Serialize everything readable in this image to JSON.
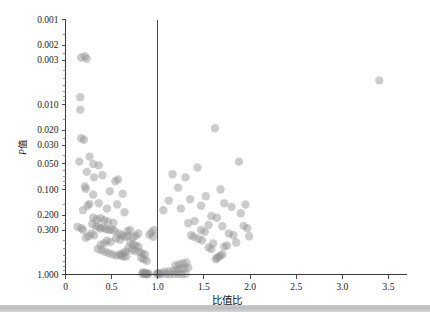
{
  "chart_data": {
    "type": "scatter",
    "title": "",
    "xlabel": "比值比",
    "ylabel": "P值",
    "ylabel_italic_part": "P",
    "ylabel_plain_part": "值",
    "xlim": [
      0,
      3.5
    ],
    "ylim": [
      1.0,
      0.001
    ],
    "y_scale": "log-inverted",
    "grid": false,
    "legend": null,
    "xticks": [
      0,
      0.5,
      1.0,
      1.5,
      2.0,
      2.5,
      3.0,
      3.5
    ],
    "xticklabels": [
      "0",
      "0.5",
      "1.0",
      "1.5",
      "2.0",
      "2.5",
      "3.0",
      "3.5"
    ],
    "yticks": [
      0.001,
      0.002,
      0.003,
      0.01,
      0.02,
      0.03,
      0.05,
      0.1,
      0.2,
      0.3,
      1.0
    ],
    "yticklabels": [
      "0.001",
      "0.002",
      "0.003",
      "0.010",
      "0.020",
      "0.030",
      "0.050",
      "0.100",
      "0.200",
      "0.300",
      "1.000"
    ],
    "reference_lines": [
      {
        "orientation": "vertical",
        "value": 1.0,
        "label": "null-effect-line"
      }
    ],
    "marker": {
      "shape": "circle",
      "color": "#8e8e8e",
      "opacity": 0.45,
      "radius_px": 4.2
    },
    "points": [
      {
        "x": 0.17,
        "y": 0.0028
      },
      {
        "x": 0.21,
        "y": 0.0027
      },
      {
        "x": 0.23,
        "y": 0.0029
      },
      {
        "x": 0.16,
        "y": 0.0082
      },
      {
        "x": 0.16,
        "y": 0.0115
      },
      {
        "x": 0.17,
        "y": 0.025
      },
      {
        "x": 0.15,
        "y": 0.047
      },
      {
        "x": 0.3,
        "y": 0.05
      },
      {
        "x": 3.4,
        "y": 0.0052
      },
      {
        "x": 1.62,
        "y": 0.019
      },
      {
        "x": 1.88,
        "y": 0.047
      },
      {
        "x": 0.2,
        "y": 0.026
      },
      {
        "x": 0.26,
        "y": 0.041
      },
      {
        "x": 0.36,
        "y": 0.052
      },
      {
        "x": 0.23,
        "y": 0.062
      },
      {
        "x": 0.4,
        "y": 0.068
      },
      {
        "x": 0.31,
        "y": 0.072
      },
      {
        "x": 0.21,
        "y": 0.092
      },
      {
        "x": 0.22,
        "y": 0.098
      },
      {
        "x": 0.54,
        "y": 0.08
      },
      {
        "x": 0.57,
        "y": 0.076
      },
      {
        "x": 0.48,
        "y": 0.105
      },
      {
        "x": 0.3,
        "y": 0.115
      },
      {
        "x": 0.62,
        "y": 0.112
      },
      {
        "x": 0.24,
        "y": 0.155
      },
      {
        "x": 0.26,
        "y": 0.148
      },
      {
        "x": 0.36,
        "y": 0.145
      },
      {
        "x": 0.45,
        "y": 0.168
      },
      {
        "x": 0.19,
        "y": 0.175
      },
      {
        "x": 0.56,
        "y": 0.15
      },
      {
        "x": 0.64,
        "y": 0.185
      },
      {
        "x": 1.16,
        "y": 0.066
      },
      {
        "x": 1.3,
        "y": 0.072
      },
      {
        "x": 1.22,
        "y": 0.095
      },
      {
        "x": 1.43,
        "y": 0.055
      },
      {
        "x": 1.12,
        "y": 0.135
      },
      {
        "x": 1.35,
        "y": 0.13
      },
      {
        "x": 1.52,
        "y": 0.12
      },
      {
        "x": 1.06,
        "y": 0.175
      },
      {
        "x": 1.25,
        "y": 0.168
      },
      {
        "x": 1.47,
        "y": 0.155
      },
      {
        "x": 1.68,
        "y": 0.1
      },
      {
        "x": 1.72,
        "y": 0.145
      },
      {
        "x": 1.8,
        "y": 0.16
      },
      {
        "x": 1.95,
        "y": 0.15
      },
      {
        "x": 1.9,
        "y": 0.19
      },
      {
        "x": 1.58,
        "y": 0.205
      },
      {
        "x": 1.64,
        "y": 0.215
      },
      {
        "x": 1.4,
        "y": 0.235
      },
      {
        "x": 1.33,
        "y": 0.25
      },
      {
        "x": 1.55,
        "y": 0.262
      },
      {
        "x": 1.7,
        "y": 0.27
      },
      {
        "x": 1.93,
        "y": 0.268
      },
      {
        "x": 1.97,
        "y": 0.285
      },
      {
        "x": 0.13,
        "y": 0.275
      },
      {
        "x": 0.17,
        "y": 0.285
      },
      {
        "x": 0.19,
        "y": 0.3
      },
      {
        "x": 0.29,
        "y": 0.255
      },
      {
        "x": 0.33,
        "y": 0.27
      },
      {
        "x": 0.36,
        "y": 0.278
      },
      {
        "x": 0.38,
        "y": 0.288
      },
      {
        "x": 0.41,
        "y": 0.282
      },
      {
        "x": 0.44,
        "y": 0.292
      },
      {
        "x": 0.47,
        "y": 0.3
      },
      {
        "x": 0.5,
        "y": 0.296
      },
      {
        "x": 0.53,
        "y": 0.305
      },
      {
        "x": 0.3,
        "y": 0.215
      },
      {
        "x": 0.34,
        "y": 0.225
      },
      {
        "x": 0.38,
        "y": 0.218
      },
      {
        "x": 0.42,
        "y": 0.23
      },
      {
        "x": 0.46,
        "y": 0.24
      },
      {
        "x": 0.52,
        "y": 0.248
      },
      {
        "x": 0.58,
        "y": 0.33
      },
      {
        "x": 0.61,
        "y": 0.345
      },
      {
        "x": 0.64,
        "y": 0.36
      },
      {
        "x": 0.67,
        "y": 0.352
      },
      {
        "x": 0.55,
        "y": 0.375
      },
      {
        "x": 0.59,
        "y": 0.39
      },
      {
        "x": 0.45,
        "y": 0.4
      },
      {
        "x": 0.49,
        "y": 0.415
      },
      {
        "x": 0.42,
        "y": 0.43
      },
      {
        "x": 0.38,
        "y": 0.445
      },
      {
        "x": 0.7,
        "y": 0.42
      },
      {
        "x": 0.73,
        "y": 0.44
      },
      {
        "x": 0.76,
        "y": 0.455
      },
      {
        "x": 0.79,
        "y": 0.47
      },
      {
        "x": 0.68,
        "y": 0.49
      },
      {
        "x": 0.72,
        "y": 0.51
      },
      {
        "x": 0.75,
        "y": 0.53
      },
      {
        "x": 0.8,
        "y": 0.545
      },
      {
        "x": 0.83,
        "y": 0.56
      },
      {
        "x": 0.86,
        "y": 0.58
      },
      {
        "x": 0.6,
        "y": 0.6
      },
      {
        "x": 0.63,
        "y": 0.62
      },
      {
        "x": 0.66,
        "y": 0.61
      },
      {
        "x": 0.82,
        "y": 0.64
      },
      {
        "x": 0.85,
        "y": 0.66
      },
      {
        "x": 0.88,
        "y": 0.69
      },
      {
        "x": 0.84,
        "y": 0.94
      },
      {
        "x": 0.86,
        "y": 0.96
      },
      {
        "x": 0.87,
        "y": 0.975
      },
      {
        "x": 0.88,
        "y": 0.985
      },
      {
        "x": 0.89,
        "y": 0.995
      },
      {
        "x": 0.85,
        "y": 0.99
      },
      {
        "x": 0.83,
        "y": 0.98
      },
      {
        "x": 0.9,
        "y": 0.97
      },
      {
        "x": 1.0,
        "y": 0.96
      },
      {
        "x": 1.01,
        "y": 0.98
      },
      {
        "x": 1.02,
        "y": 0.995
      },
      {
        "x": 0.99,
        "y": 0.99
      },
      {
        "x": 1.04,
        "y": 0.975
      },
      {
        "x": 1.09,
        "y": 0.985
      },
      {
        "x": 1.13,
        "y": 0.995
      },
      {
        "x": 1.18,
        "y": 0.99
      },
      {
        "x": 1.22,
        "y": 0.98
      },
      {
        "x": 1.26,
        "y": 0.995
      },
      {
        "x": 1.3,
        "y": 0.988
      },
      {
        "x": 1.07,
        "y": 0.93
      },
      {
        "x": 1.12,
        "y": 0.915
      },
      {
        "x": 1.17,
        "y": 0.9
      },
      {
        "x": 1.21,
        "y": 0.88
      },
      {
        "x": 1.25,
        "y": 0.86
      },
      {
        "x": 1.29,
        "y": 0.845
      },
      {
        "x": 1.33,
        "y": 0.83
      },
      {
        "x": 1.19,
        "y": 0.78
      },
      {
        "x": 1.23,
        "y": 0.76
      },
      {
        "x": 1.27,
        "y": 0.74
      },
      {
        "x": 1.31,
        "y": 0.72
      },
      {
        "x": 1.64,
        "y": 0.64
      },
      {
        "x": 1.66,
        "y": 0.62
      },
      {
        "x": 1.68,
        "y": 0.6
      },
      {
        "x": 1.63,
        "y": 0.66
      },
      {
        "x": 1.7,
        "y": 0.58
      },
      {
        "x": 1.55,
        "y": 0.48
      },
      {
        "x": 1.58,
        "y": 0.5
      },
      {
        "x": 1.72,
        "y": 0.47
      },
      {
        "x": 1.75,
        "y": 0.455
      },
      {
        "x": 1.6,
        "y": 0.43
      },
      {
        "x": 1.85,
        "y": 0.42
      },
      {
        "x": 1.48,
        "y": 0.395
      },
      {
        "x": 1.44,
        "y": 0.38
      },
      {
        "x": 1.39,
        "y": 0.36
      },
      {
        "x": 1.36,
        "y": 0.345
      },
      {
        "x": 0.96,
        "y": 0.3
      },
      {
        "x": 0.93,
        "y": 0.32
      },
      {
        "x": 0.91,
        "y": 0.34
      },
      {
        "x": 0.95,
        "y": 0.36
      },
      {
        "x": 0.79,
        "y": 0.33
      },
      {
        "x": 0.76,
        "y": 0.35
      },
      {
        "x": 0.73,
        "y": 0.365
      },
      {
        "x": 0.7,
        "y": 0.3
      },
      {
        "x": 0.67,
        "y": 0.31
      },
      {
        "x": 0.28,
        "y": 0.33
      },
      {
        "x": 0.31,
        "y": 0.345
      },
      {
        "x": 0.25,
        "y": 0.355
      },
      {
        "x": 0.22,
        "y": 0.37
      },
      {
        "x": 0.35,
        "y": 0.5
      },
      {
        "x": 0.39,
        "y": 0.52
      },
      {
        "x": 0.43,
        "y": 0.54
      },
      {
        "x": 0.47,
        "y": 0.56
      },
      {
        "x": 0.51,
        "y": 0.58
      },
      {
        "x": 0.55,
        "y": 0.6
      },
      {
        "x": 0.59,
        "y": 0.58
      },
      {
        "x": 0.62,
        "y": 0.56
      },
      {
        "x": 0.65,
        "y": 0.54
      },
      {
        "x": 1.47,
        "y": 0.3
      },
      {
        "x": 1.51,
        "y": 0.315
      },
      {
        "x": 1.77,
        "y": 0.33
      },
      {
        "x": 1.82,
        "y": 0.345
      },
      {
        "x": 1.99,
        "y": 0.355
      }
    ]
  }
}
